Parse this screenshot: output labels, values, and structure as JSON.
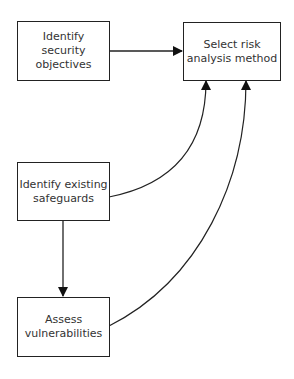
{
  "diagram": {
    "nodes": [
      {
        "id": "objectives",
        "label": "Identify\nsecurity\nobjectives"
      },
      {
        "id": "method",
        "label": "Select risk\nanalysis method"
      },
      {
        "id": "safeguards",
        "label": "Identify existing\nsafeguards"
      },
      {
        "id": "vulnerabilities",
        "label": "Assess\nvulnerabilities"
      }
    ],
    "edges": [
      {
        "from": "objectives",
        "to": "method",
        "style": "straight"
      },
      {
        "from": "safeguards",
        "to": "method",
        "style": "curved"
      },
      {
        "from": "vulnerabilities",
        "to": "method",
        "style": "curved"
      },
      {
        "from": "safeguards",
        "to": "vulnerabilities",
        "style": "straight"
      }
    ],
    "colors": {
      "stroke": "#222222",
      "text": "#333333",
      "background": "#ffffff"
    }
  }
}
